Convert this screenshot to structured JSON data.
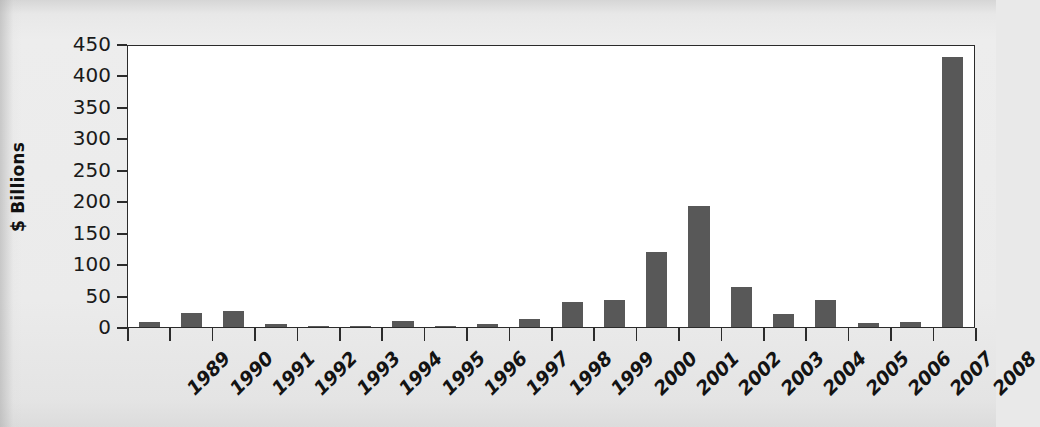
{
  "chart_data": {
    "type": "bar",
    "title": "",
    "xlabel": "",
    "ylabel": "$ Billions",
    "ylim": [
      0,
      450
    ],
    "yticks": [
      0,
      50,
      100,
      150,
      200,
      250,
      300,
      350,
      400,
      450
    ],
    "ytick_labels": [
      "0",
      "50",
      "100",
      "150",
      "200",
      "250",
      "300",
      "350",
      "400",
      "450"
    ],
    "grid": false,
    "legend": null,
    "bar_color": "#585858",
    "plot_background": "#ffffff",
    "page_background": "#e9e9e9",
    "axis_color": "#2b2b2b",
    "categories": [
      "1989",
      "1990",
      "1991",
      "1992",
      "1993",
      "1994",
      "1995",
      "1996",
      "1997",
      "1998",
      "1999",
      "2000",
      "2001",
      "2002",
      "2003",
      "2004",
      "2005",
      "2006",
      "2007",
      "2008"
    ],
    "values": [
      8,
      22,
      25,
      5,
      2,
      2,
      10,
      2,
      5,
      12,
      40,
      43,
      120,
      192,
      63,
      21,
      43,
      7,
      8,
      430
    ]
  }
}
